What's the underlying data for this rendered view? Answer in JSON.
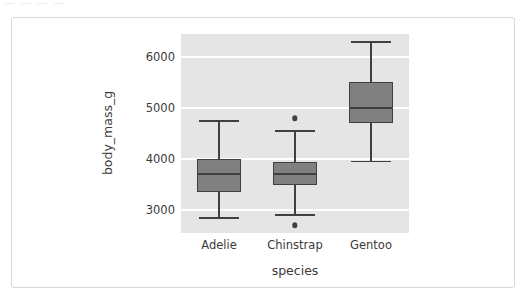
{
  "top_stub": "— — — —",
  "chart_data": {
    "type": "box",
    "title": "",
    "xlabel": "species",
    "ylabel": "body_mass_g",
    "categories": [
      "Adelie",
      "Chinstrap",
      "Gentoo"
    ],
    "ylim": [
      2550,
      6450
    ],
    "yticks": [
      3000,
      4000,
      5000,
      6000
    ],
    "ytick_labels": [
      "3000",
      "4000",
      "5000",
      "6000"
    ],
    "grid": true,
    "legend": "none",
    "panel_background": "#e5e5e5",
    "box_fill": "#808080",
    "box_edge": "#404040",
    "boxes": [
      {
        "label": "Adelie",
        "whisker_low": 2850,
        "q1": 3350,
        "median": 3700,
        "q3": 4000,
        "whisker_high": 4750,
        "outliers": []
      },
      {
        "label": "Chinstrap",
        "whisker_low": 2900,
        "q1": 3487,
        "median": 3700,
        "q3": 3950,
        "whisker_high": 4550,
        "outliers": [
          4800,
          2700
        ]
      },
      {
        "label": "Gentoo",
        "whisker_low": 3950,
        "q1": 4700,
        "median": 5000,
        "q3": 5500,
        "whisker_high": 6300,
        "outliers": []
      }
    ]
  }
}
